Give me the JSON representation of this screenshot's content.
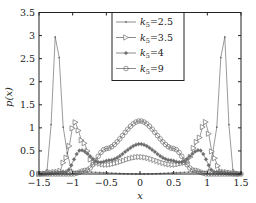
{
  "chart_data": {
    "type": "line",
    "title": "",
    "xlabel": "x",
    "ylabel": "p(x)",
    "xlim": [
      -1.5,
      1.5
    ],
    "ylim": [
      0,
      3.5
    ],
    "xticks": [
      -1.5,
      -1,
      -0.5,
      0,
      0.5,
      1,
      1.5
    ],
    "xtick_labels": [
      "−1.5",
      "−1",
      "−0.5",
      "0",
      "0.5",
      "1",
      "1.5"
    ],
    "yticks": [
      0,
      0.5,
      1,
      1.5,
      2,
      2.5,
      3,
      3.5
    ],
    "ytick_labels": [
      "0",
      "0.5",
      "1",
      "1.5",
      "2",
      "2.5",
      "3",
      "3.5"
    ],
    "grid": false,
    "legend_position": "upper center-right",
    "series": [
      {
        "name": "k5=2.5",
        "label_k": "k",
        "label_sub": "5",
        "label_val": "=2.5",
        "marker": "dot",
        "color": "#777777",
        "description": "two sharp peaks at x≈±1.24, height≈3.45; near zero elsewhere"
      },
      {
        "name": "k5=3.5",
        "label_k": "k",
        "label_sub": "5",
        "label_val": "=3.5",
        "marker": "triangle-right",
        "color": "#777777",
        "description": "side peaks at x≈±0.97, height≈1.13; small central bump ≈0.37 at x=0"
      },
      {
        "name": "k5=4",
        "label_k": "k",
        "label_sub": "5",
        "label_val": "=4",
        "marker": "star",
        "color": "#777777",
        "description": "central peak ≈0.65 at x=0; side bumps ≈0.52 at x≈±0.88"
      },
      {
        "name": "k5=9",
        "label_k": "k",
        "label_sub": "5",
        "label_val": "=9",
        "marker": "circle",
        "color": "#777777",
        "description": "single broad central peak ≈1.15 at x=0, falling to 0 near x≈±1"
      }
    ],
    "key_points": {
      "k5=2.5": {
        "x": [
          -1.5,
          -1.35,
          -1.3,
          -1.24,
          -1.18,
          -1.12,
          -1.0,
          0,
          1.0,
          1.12,
          1.18,
          1.24,
          1.3,
          1.35,
          1.5
        ],
        "y": [
          0,
          0.1,
          1.6,
          3.45,
          2.2,
          0.6,
          0.05,
          0,
          0.05,
          0.6,
          2.2,
          3.45,
          1.6,
          0.1,
          0
        ]
      },
      "k5=3.5": {
        "x": [
          -1.5,
          -1.2,
          -1.1,
          -0.97,
          -0.85,
          -0.7,
          -0.5,
          0,
          0.5,
          0.7,
          0.85,
          0.97,
          1.1,
          1.2,
          1.5
        ],
        "y": [
          0,
          0.05,
          0.35,
          1.13,
          0.7,
          0.25,
          0.2,
          0.37,
          0.2,
          0.25,
          0.7,
          1.13,
          0.35,
          0.05,
          0
        ]
      },
      "k5=4": {
        "x": [
          -1.5,
          -1.1,
          -0.88,
          -0.6,
          -0.45,
          0,
          0.45,
          0.6,
          0.88,
          1.1,
          1.5
        ],
        "y": [
          0,
          0.05,
          0.52,
          0.25,
          0.3,
          0.65,
          0.3,
          0.25,
          0.52,
          0.05,
          0
        ]
      },
      "k5=9": {
        "x": [
          -1.5,
          -1.0,
          -0.8,
          -0.5,
          0,
          0.5,
          0.8,
          1.0,
          1.5
        ],
        "y": [
          0,
          0.0,
          0.08,
          0.55,
          1.15,
          0.55,
          0.08,
          0.0,
          0
        ]
      }
    }
  }
}
